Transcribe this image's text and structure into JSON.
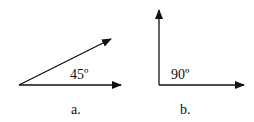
{
  "diagrams": [
    {
      "id": "a",
      "caption": "a.",
      "angle_label": "45º",
      "angle_degrees": 45,
      "vectors": [
        "horizontal-arrow",
        "diagonal-arrow"
      ]
    },
    {
      "id": "b",
      "caption": "b.",
      "angle_label": "90º",
      "angle_degrees": 90,
      "vectors": [
        "vertical-arrow",
        "horizontal-arrow"
      ]
    }
  ],
  "colors": {
    "stroke": "#111111",
    "background": "#ffffff"
  }
}
